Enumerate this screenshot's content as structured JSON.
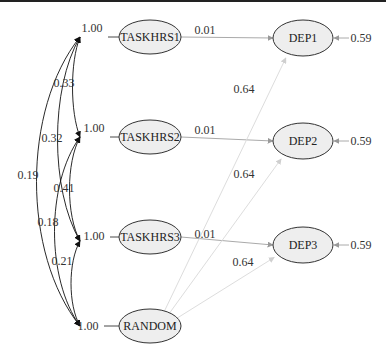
{
  "diagram": {
    "type": "path-diagram",
    "exogenous": [
      {
        "id": "TASKHRS1",
        "label": "TASKHRS1",
        "variance": "1.00"
      },
      {
        "id": "TASKHRS2",
        "label": "TASKHRS2",
        "variance": "1.00"
      },
      {
        "id": "TASKHRS3",
        "label": "TASKHRS3",
        "variance": "1.00"
      },
      {
        "id": "RANDOM",
        "label": "RANDOM",
        "variance": "1.00"
      }
    ],
    "endogenous": [
      {
        "id": "DEP1",
        "label": "DEP1",
        "residual": "0.59"
      },
      {
        "id": "DEP2",
        "label": "DEP2",
        "residual": "0.59"
      },
      {
        "id": "DEP3",
        "label": "DEP3",
        "residual": "0.59"
      }
    ],
    "paths": [
      {
        "from": "TASKHRS1",
        "to": "DEP1",
        "value": "0.01"
      },
      {
        "from": "TASKHRS2",
        "to": "DEP2",
        "value": "0.01"
      },
      {
        "from": "TASKHRS3",
        "to": "DEP3",
        "value": "0.01"
      },
      {
        "from": "RANDOM",
        "to": "DEP1",
        "value": "0.64"
      },
      {
        "from": "RANDOM",
        "to": "DEP2",
        "value": "0.64"
      },
      {
        "from": "RANDOM",
        "to": "DEP3",
        "value": "0.64"
      }
    ],
    "covariances": [
      {
        "a": "TASKHRS1",
        "b": "TASKHRS2",
        "value": "0.33"
      },
      {
        "a": "TASKHRS1",
        "b": "TASKHRS3",
        "value": "0.32"
      },
      {
        "a": "TASKHRS1",
        "b": "RANDOM",
        "value": "0.19"
      },
      {
        "a": "TASKHRS2",
        "b": "TASKHRS3",
        "value": "0.41"
      },
      {
        "a": "TASKHRS2",
        "b": "RANDOM",
        "value": "0.18"
      },
      {
        "a": "TASKHRS3",
        "b": "RANDOM",
        "value": "0.21"
      }
    ]
  },
  "colors": {
    "node_fill": "#eeeeee",
    "node_stroke": "#333333",
    "covariance_stroke": "#111111",
    "path_stroke": "#aaaaaa",
    "random_path_stroke": "#dddddd"
  }
}
